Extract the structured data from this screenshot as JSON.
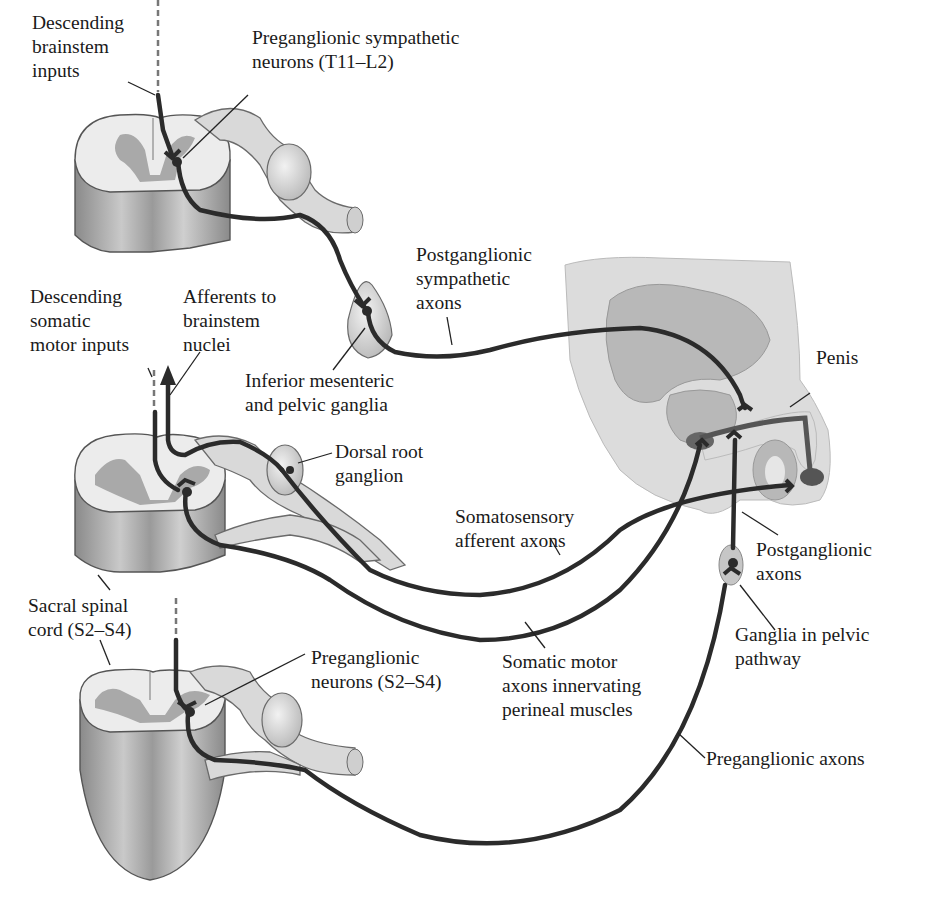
{
  "figure": {
    "colors": {
      "axon": "#2b2b2b",
      "gray_matter": "#a9a9a9",
      "white_matter": "#ececec",
      "nerve": "#d9d9d9",
      "label_text": "#1a1a1a"
    }
  },
  "labels": {
    "descending_brainstem": "Descending\nbrainstem\ninputs",
    "preganglionic_sympathetic": "Preganglionic sympathetic\nneurons (T11–L2)",
    "postganglionic_sympathetic": "Postganglionic\nsympathetic\naxons",
    "descending_somatic": "Descending\nsomatic\nmotor inputs",
    "afferents_brainstem": "Afferents to\nbrainstem\nnuclei",
    "inferior_mesenteric": "Inferior mesenteric\nand pelvic ganglia",
    "penis": "Penis",
    "dorsal_root_ganglion": "Dorsal root\nganglion",
    "somatosensory_afferent": "Somatosensory\nafferent axons",
    "postganglionic_axons": "Postganglionic\naxons",
    "sacral_spinal_cord": "Sacral spinal\ncord (S2–S4)",
    "ganglia_pelvic": "Ganglia in pelvic\npathway",
    "preganglionic_neurons_s2s4": "Preganglionic\nneurons (S2–S4)",
    "somatic_motor": "Somatic motor\naxons innervating\nperineal muscles",
    "preganglionic_axons": "Preganglionic axons"
  }
}
